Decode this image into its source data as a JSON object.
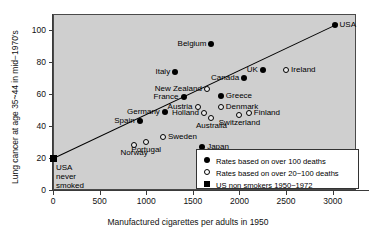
{
  "chart_data": {
    "type": "scatter",
    "title": "",
    "xlabel": "Manufactured cigarettes per adults in 1950",
    "ylabel": "Lung cancer at age 35~44 in mid−1970's",
    "xlim": [
      0,
      3250
    ],
    "ylim": [
      0,
      110
    ],
    "xticks": [
      0,
      500,
      1000,
      1500,
      2000,
      2500,
      3000
    ],
    "xtick_labels": [
      "0",
      "500",
      "1000",
      "1500",
      "2000",
      "2500",
      "3000"
    ],
    "yticks": [
      0,
      20,
      40,
      60,
      80,
      100
    ],
    "ytick_labels": [
      "0",
      "20",
      "40",
      "60",
      "80",
      "100"
    ],
    "grid": false,
    "legend_position": "bottom-right",
    "annotation": "USA\nnever\nsmoked",
    "trendline": {
      "x0": 0,
      "y0": 20,
      "x1": 3050,
      "y1": 104
    },
    "points": [
      {
        "label": "Belgium",
        "x": 1700,
        "y": 91,
        "marker": "filled",
        "label_side": "left"
      },
      {
        "label": "USA",
        "x": 3020,
        "y": 103,
        "marker": "filled",
        "label_side": "right"
      },
      {
        "label": "UK",
        "x": 2250,
        "y": 75,
        "marker": "filled",
        "label_side": "left"
      },
      {
        "label": "Ireland",
        "x": 2500,
        "y": 75,
        "marker": "open",
        "label_side": "right"
      },
      {
        "label": "Italy",
        "x": 1310,
        "y": 74,
        "marker": "filled",
        "label_side": "left"
      },
      {
        "label": "Canada",
        "x": 2050,
        "y": 70,
        "marker": "filled",
        "label_side": "left"
      },
      {
        "label": "New Zealand",
        "x": 1650,
        "y": 63,
        "marker": "open",
        "label_side": "left"
      },
      {
        "label": "Greece",
        "x": 1800,
        "y": 59,
        "marker": "filled",
        "label_side": "right"
      },
      {
        "label": "France",
        "x": 1400,
        "y": 58,
        "marker": "filled",
        "label_side": "left"
      },
      {
        "label": "Austria",
        "x": 1550,
        "y": 52,
        "marker": "open",
        "label_side": "left"
      },
      {
        "label": "Denmark",
        "x": 1800,
        "y": 52,
        "marker": "open",
        "label_side": "right"
      },
      {
        "label": "Holland",
        "x": 1620,
        "y": 48,
        "marker": "open",
        "label_side": "left"
      },
      {
        "label": "Germany",
        "x": 1200,
        "y": 49,
        "marker": "filled",
        "label_side": "left"
      },
      {
        "label": "Finland",
        "x": 2100,
        "y": 48,
        "marker": "open",
        "label_side": "right"
      },
      {
        "label": "Spain",
        "x": 930,
        "y": 43,
        "marker": "filled",
        "label_side": "left"
      },
      {
        "label": "Australia",
        "x": 1700,
        "y": 45,
        "marker": "open",
        "label_side": "below"
      },
      {
        "label": "Switzerland",
        "x": 2000,
        "y": 47,
        "marker": "open",
        "label_side": "below"
      },
      {
        "label": "Sweden",
        "x": 1180,
        "y": 33,
        "marker": "open",
        "label_side": "right"
      },
      {
        "label": "Portugal",
        "x": 1000,
        "y": 30,
        "marker": "open",
        "label_side": "below"
      },
      {
        "label": "Norway",
        "x": 870,
        "y": 28,
        "marker": "open",
        "label_side": "below"
      },
      {
        "label": "Japan",
        "x": 1600,
        "y": 27,
        "marker": "filled",
        "label_side": "right"
      },
      {
        "label": "USA never smoked",
        "x": 0,
        "y": 20,
        "marker": "square",
        "label_side": "none"
      }
    ],
    "legend": [
      {
        "marker": "filled",
        "text": "Rates based on over 100 deaths"
      },
      {
        "marker": "open",
        "text": "Rates based on over 20~100 deaths"
      },
      {
        "marker": "square",
        "text": "US non smokers 1950~1972"
      }
    ]
  }
}
